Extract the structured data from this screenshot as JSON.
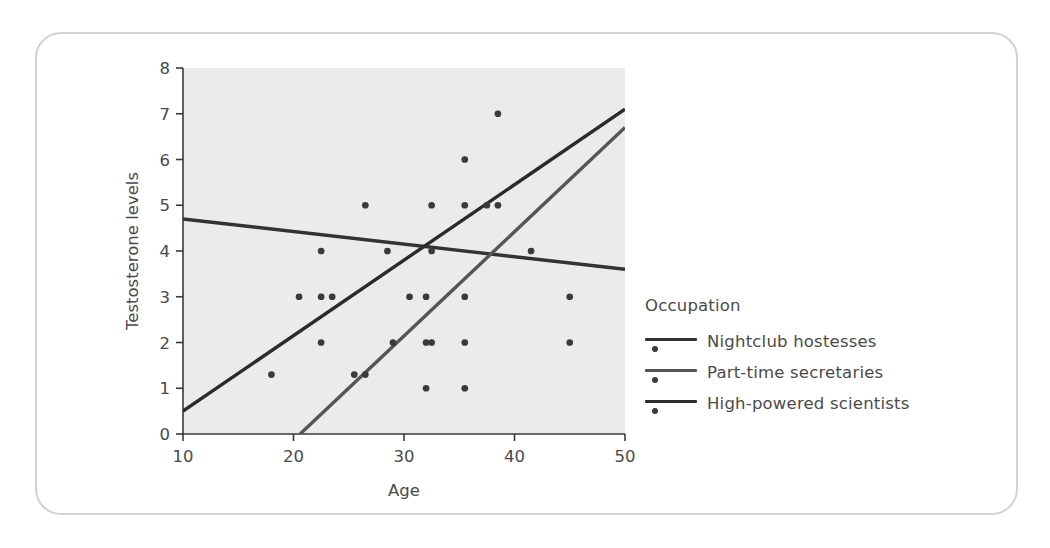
{
  "figure": {
    "frame_color": "#d2d2d2",
    "background": "#ffffff",
    "plot_background": "#ebebeb",
    "text_color": "#4a4a4a"
  },
  "legend": {
    "title": "Occupation",
    "entries": [
      {
        "label": "Nightclub hostesses",
        "color": "#333333",
        "marker": "line-and-dot"
      },
      {
        "label": "Part-time secretaries",
        "color": "#555555",
        "marker": "line-and-dot"
      },
      {
        "label": "High-powered scientists",
        "color": "#2b2b2b",
        "marker": "line-and-dot"
      }
    ]
  },
  "chart_data": {
    "type": "scatter",
    "title": "",
    "xlabel": "Age",
    "ylabel": "Testosterone levels",
    "xlim": [
      10,
      50
    ],
    "ylim": [
      0,
      8
    ],
    "xticks": [
      10,
      20,
      30,
      40,
      50
    ],
    "yticks": [
      0,
      1,
      2,
      3,
      4,
      5,
      6,
      7,
      8
    ],
    "grid": false,
    "legend_position": "right",
    "legend_title": "Occupation",
    "series": [
      {
        "name": "Nightclub hostesses",
        "color": "#333333",
        "trendline": {
          "x": [
            10,
            50
          ],
          "y": [
            4.7,
            3.6
          ]
        },
        "points": []
      },
      {
        "name": "Part-time secretaries",
        "color": "#555555",
        "trendline": {
          "x": [
            20.6,
            50
          ],
          "y": [
            0,
            6.7
          ]
        },
        "points": []
      },
      {
        "name": "High-powered scientists",
        "color": "#2b2b2b",
        "trendline": {
          "x": [
            10,
            50
          ],
          "y": [
            0.5,
            7.1
          ]
        },
        "points": []
      }
    ],
    "points": [
      {
        "x": 18.0,
        "y": 1.3
      },
      {
        "x": 20.5,
        "y": 3.0
      },
      {
        "x": 22.5,
        "y": 3.0
      },
      {
        "x": 23.5,
        "y": 3.0
      },
      {
        "x": 22.5,
        "y": 4.0
      },
      {
        "x": 22.5,
        "y": 2.0
      },
      {
        "x": 25.5,
        "y": 1.3
      },
      {
        "x": 26.5,
        "y": 1.3
      },
      {
        "x": 26.5,
        "y": 5.0
      },
      {
        "x": 28.5,
        "y": 4.0
      },
      {
        "x": 29.0,
        "y": 2.0
      },
      {
        "x": 30.5,
        "y": 3.0
      },
      {
        "x": 32.0,
        "y": 3.0
      },
      {
        "x": 32.5,
        "y": 5.0
      },
      {
        "x": 32.5,
        "y": 4.0
      },
      {
        "x": 32.0,
        "y": 2.0
      },
      {
        "x": 32.5,
        "y": 2.0
      },
      {
        "x": 32.0,
        "y": 1.0
      },
      {
        "x": 35.5,
        "y": 6.0
      },
      {
        "x": 35.5,
        "y": 5.0
      },
      {
        "x": 35.5,
        "y": 3.0
      },
      {
        "x": 35.5,
        "y": 2.0
      },
      {
        "x": 35.5,
        "y": 1.0
      },
      {
        "x": 37.5,
        "y": 5.0
      },
      {
        "x": 38.5,
        "y": 5.0
      },
      {
        "x": 38.5,
        "y": 7.0
      },
      {
        "x": 41.5,
        "y": 4.0
      },
      {
        "x": 45.0,
        "y": 3.0
      },
      {
        "x": 45.0,
        "y": 2.0
      }
    ],
    "point_color": "#3a3a3a",
    "point_size": 5.2
  }
}
